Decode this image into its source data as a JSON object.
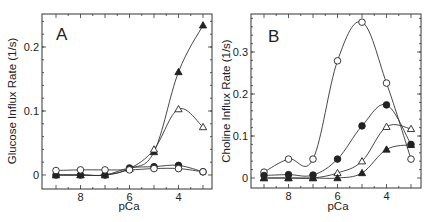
{
  "figure": {
    "panels": [
      {
        "id": "A",
        "letter": "A",
        "ylabel": "Glucose Influx Rate (1/s)",
        "xlabel": "pCa"
      },
      {
        "id": "B",
        "letter": "B",
        "ylabel": "Choline Influx Rate (1/s)",
        "xlabel": "pCa"
      }
    ]
  },
  "chart_data": [
    {
      "type": "line",
      "title": "A",
      "xlabel": "pCa",
      "ylabel": "Glucose Influx Rate (1/s)",
      "x": [
        9,
        8,
        7,
        6,
        5,
        4,
        3
      ],
      "xlim": [
        9.5,
        2.6
      ],
      "x_reversed": true,
      "xticks": [
        8,
        6,
        4
      ],
      "ylim": [
        -0.022,
        0.25
      ],
      "yticks": [
        0,
        0.1,
        0.2
      ],
      "ytick_labels": [
        "0",
        "0.1",
        "0.2"
      ],
      "grid": false,
      "legend": "none",
      "series": [
        {
          "name": "filled-triangle",
          "marker": "triangle",
          "filled": true,
          "values": [
            0.0,
            0.0,
            0.0,
            0.01,
            0.036,
            0.161,
            0.234
          ]
        },
        {
          "name": "open-triangle",
          "marker": "triangle",
          "filled": false,
          "values": [
            0.0,
            0.0,
            0.0,
            0.01,
            0.04,
            0.103,
            0.075
          ]
        },
        {
          "name": "filled-circle",
          "marker": "circle",
          "filled": true,
          "values": [
            0.0,
            0.0,
            0.0,
            0.011,
            0.013,
            0.015,
            0.005
          ]
        },
        {
          "name": "open-circle",
          "marker": "circle",
          "filled": false,
          "values": [
            0.007,
            0.008,
            0.008,
            0.008,
            0.01,
            0.01,
            0.005
          ]
        }
      ]
    },
    {
      "type": "line",
      "title": "B",
      "xlabel": "pCa",
      "ylabel": "Choline Influx Rate (1/s)",
      "x": [
        9,
        8,
        7,
        6,
        5,
        4,
        3
      ],
      "xlim": [
        9.5,
        2.6
      ],
      "x_reversed": true,
      "xticks": [
        8,
        6,
        4
      ],
      "ylim": [
        -0.022,
        0.39
      ],
      "yticks": [
        0,
        0.1,
        0.2,
        0.3
      ],
      "ytick_labels": [
        "0",
        "0.1",
        "0.2",
        "0.3"
      ],
      "grid": false,
      "legend": "none",
      "series": [
        {
          "name": "open-circle",
          "marker": "circle",
          "filled": false,
          "values": [
            0.014,
            0.045,
            0.045,
            0.279,
            0.371,
            0.226,
            0.045
          ]
        },
        {
          "name": "filled-circle",
          "marker": "circle",
          "filled": true,
          "values": [
            0.006,
            0.008,
            0.007,
            0.045,
            0.124,
            0.174,
            0.08
          ]
        },
        {
          "name": "open-triangle",
          "marker": "triangle",
          "filled": false,
          "values": [
            0.0,
            0.0,
            0.0,
            0.012,
            0.04,
            0.122,
            0.117
          ]
        },
        {
          "name": "filled-triangle",
          "marker": "triangle",
          "filled": true,
          "values": [
            0.0,
            0.0,
            0.0,
            0.0,
            0.012,
            0.068,
            0.079
          ]
        }
      ]
    }
  ],
  "layout": {
    "panels": [
      {
        "frame": {
          "left": 42,
          "top": 14,
          "right": 212,
          "bottom": 189
        },
        "px_per_x": 24.5,
        "x_at_9": 56,
        "y_zero": 175,
        "px_per_y": 640,
        "letter_pos": [
          56,
          40
        ]
      },
      {
        "frame": {
          "left": 251,
          "top": 14,
          "right": 421,
          "bottom": 188
        },
        "px_per_x": 24.5,
        "x_at_9": 264,
        "y_zero": 178,
        "px_per_y": 420,
        "letter_pos": [
          268,
          42
        ]
      }
    ]
  }
}
